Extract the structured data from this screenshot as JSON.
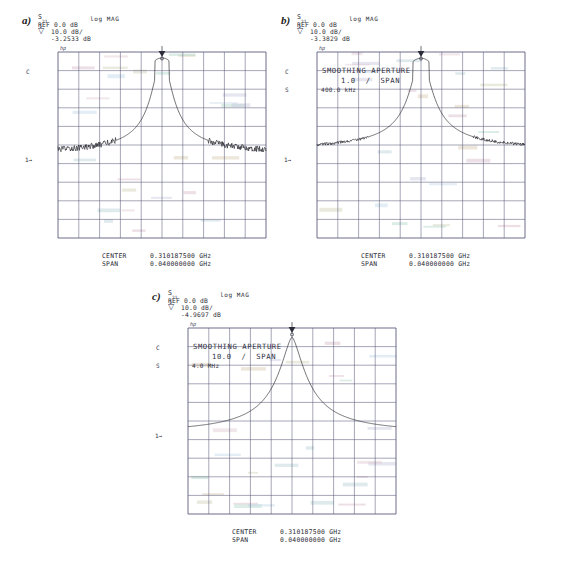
{
  "figure": {
    "background": "#ffffff",
    "trace_color": "#1a1a22",
    "grid_color": "#5b5b7a",
    "text_color": "#2b2b35"
  },
  "panels": [
    {
      "letter": "a)",
      "hp_logo": "hp",
      "parameter": "S",
      "parameter_sub": "21",
      "format": "log MAG",
      "reference": "REF 0.0 dB",
      "scale": "10.0 dB/",
      "marker_number": "1",
      "marker_value": "-3.2533 dB",
      "channel_c": "C",
      "channel_s": "",
      "ref_marker": "1→",
      "smoothing_label": "",
      "smoothing_span": "",
      "smoothing_value": "",
      "center_label": "CENTER",
      "center_value": "0.310187500 GHz",
      "span_label": "SPAN",
      "span_value": "0.040000000 GHz"
    },
    {
      "letter": "b)",
      "hp_logo": "hp",
      "parameter": "S",
      "parameter_sub": "21",
      "format": "log MAG",
      "reference": "REF 0.0 dB",
      "scale": "10.0 dB/",
      "marker_number": "1",
      "marker_value": "-3.3829 dB",
      "channel_c": "C",
      "channel_s": "S",
      "ref_marker": "1→",
      "smoothing_label": "SMOOTHING APERTURE",
      "smoothing_span": "1.0  /  SPAN",
      "smoothing_value": "400.0 kHz",
      "center_label": "CENTER",
      "center_value": "0.310187500 GHz",
      "span_label": "SPAN",
      "span_value": "0.040000000 GHz"
    },
    {
      "letter": "c)",
      "hp_logo": "hp",
      "parameter": "S",
      "parameter_sub": "21",
      "format": "log MAG",
      "reference": "REF 0.0 dB",
      "scale": "10.0 dB/",
      "marker_number": "1",
      "marker_value": "-4.9697 dB",
      "channel_c": "C",
      "channel_s": "S",
      "ref_marker": "1→",
      "smoothing_label": "SMOOTHING APERTURE",
      "smoothing_span": "10.0  /  SPAN",
      "smoothing_value": "4.0 MHz",
      "center_label": "CENTER",
      "center_value": "0.310187500 GHz",
      "span_label": "SPAN",
      "span_value": "0.040000000 GHz"
    }
  ],
  "chart_data": [
    {
      "type": "line",
      "title": "a) S21 log MAG - unsmoothed",
      "xlabel": "Frequency",
      "ylabel": "S21 (dB)",
      "center_frequency_ghz": 0.3101875,
      "span_ghz": 0.04,
      "reference_level_db": 0.0,
      "scale_db_per_div": 10.0,
      "marker1_db": -3.2533,
      "grid_divisions_x": 10,
      "grid_divisions_y": 10,
      "ylim": [
        -100,
        0
      ],
      "smoothing": "none",
      "noise_floor_db": -62,
      "peak_db": -3.25,
      "notes": "Sharp resonance peak centered at mid-span, heavy noise on both skirts below -55 dB"
    },
    {
      "type": "line",
      "title": "b) S21 log MAG - 1.0% span smoothing (400.0 kHz)",
      "xlabel": "Frequency",
      "ylabel": "S21 (dB)",
      "center_frequency_ghz": 0.3101875,
      "span_ghz": 0.04,
      "reference_level_db": 0.0,
      "scale_db_per_div": 10.0,
      "marker1_db": -3.3829,
      "grid_divisions_x": 10,
      "grid_divisions_y": 10,
      "ylim": [
        -100,
        0
      ],
      "smoothing": "1.0 % span / 400.0 kHz",
      "noise_floor_db": -58,
      "peak_db": -3.38,
      "notes": "Same resonance with moderate smoothing; reduced noise, slightly rounded peak"
    },
    {
      "type": "line",
      "title": "c) S21 log MAG - 10.0% span smoothing (4.0 MHz)",
      "xlabel": "Frequency",
      "ylabel": "S21 (dB)",
      "center_frequency_ghz": 0.3101875,
      "span_ghz": 0.04,
      "reference_level_db": 0.0,
      "scale_db_per_div": 10.0,
      "marker1_db": -4.9697,
      "grid_divisions_x": 10,
      "grid_divisions_y": 10,
      "ylim": [
        -100,
        0
      ],
      "smoothing": "10.0 % span / 4.0 MHz",
      "noise_floor_db": -56,
      "peak_db": -4.97,
      "notes": "Heavy smoothing: noise fully removed, peak broadened and attenuated to -4.97 dB"
    }
  ]
}
